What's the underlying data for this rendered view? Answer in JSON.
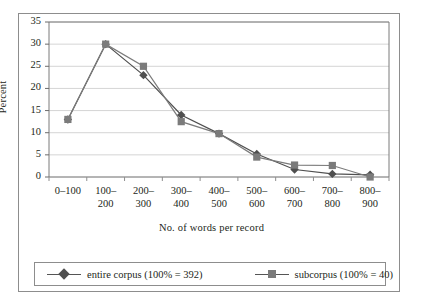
{
  "chart_data": {
    "type": "line",
    "title": "",
    "xlabel": "No. of words per record",
    "ylabel": "Percent",
    "categories": [
      "0–100",
      "100–200",
      "200–300",
      "300–400",
      "400–500",
      "500–600",
      "600–700",
      "700–800",
      "800–900"
    ],
    "series": [
      {
        "name": "entire corpus (100% = 392)",
        "marker": "diamond",
        "color": "#4f4f4f",
        "values": [
          13.0,
          30.0,
          23.0,
          14.0,
          9.8,
          5.2,
          1.7,
          0.7,
          0.5
        ]
      },
      {
        "name": "subcorpus (100% = 40)",
        "marker": "square",
        "color": "#7b7b7b",
        "values": [
          13.0,
          30.0,
          25.0,
          12.5,
          9.8,
          4.5,
          2.7,
          2.6,
          0.0
        ]
      }
    ],
    "ylim": [
      0,
      35
    ],
    "yticks": [
      0,
      5,
      10,
      15,
      20,
      25,
      30,
      35
    ],
    "ytick_labels": [
      "0",
      "5",
      "10",
      "15",
      "20",
      "25",
      "30",
      "35"
    ],
    "grid": "horizontal",
    "legend_position": "bottom"
  },
  "legend": {
    "entries": [
      {
        "label": "entire corpus (100% = 392)"
      },
      {
        "label": "subcorpus (100% = 40)"
      }
    ]
  },
  "axes": {
    "y_title": "Percent",
    "x_title": "No. of words per record"
  }
}
